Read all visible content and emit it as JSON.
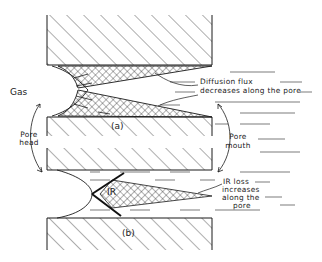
{
  "diagram": {
    "panels": [
      {
        "id": "a",
        "label": "(a)"
      },
      {
        "id": "b",
        "label": "(b)"
      }
    ],
    "labels": {
      "gas": "Gas",
      "diffusion_line1": "Diffusion flux",
      "diffusion_line2": "decreases along the pore",
      "pore_head_line1": "Pore",
      "pore_head_line2": "head",
      "pore_mouth_line1": "Pore",
      "pore_mouth_line2": "mouth",
      "ir": "IR",
      "ir_loss_line1": "IR loss",
      "ir_loss_line2": "increases",
      "ir_loss_line3": "along the",
      "ir_loss_line4": "pore"
    },
    "colors": {
      "ink": "#1a1a1a",
      "background": "#ffffff"
    }
  }
}
